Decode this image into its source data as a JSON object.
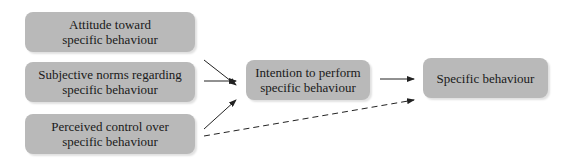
{
  "diagram": {
    "colors": {
      "box_fill": "#b9b9b9",
      "text": "#1a1a1a",
      "arrow": "#222222"
    },
    "inputs": [
      {
        "id": "attitude",
        "lines": [
          "Attitude toward",
          "specific behaviour"
        ]
      },
      {
        "id": "norms",
        "lines": [
          "Subjective norms regarding",
          "specific behaviour"
        ]
      },
      {
        "id": "control",
        "lines": [
          "Perceived control over",
          "specific behaviour"
        ]
      }
    ],
    "intention": {
      "lines": [
        "Intention to perform",
        "specific behaviour"
      ]
    },
    "behaviour": {
      "lines": [
        "Specific behaviour"
      ]
    },
    "edges": [
      {
        "from": "attitude",
        "to": "intention",
        "style": "solid"
      },
      {
        "from": "norms",
        "to": "intention",
        "style": "solid"
      },
      {
        "from": "control",
        "to": "intention",
        "style": "solid"
      },
      {
        "from": "intention",
        "to": "behaviour",
        "style": "solid"
      },
      {
        "from": "control",
        "to": "behaviour",
        "style": "dashed"
      }
    ]
  }
}
